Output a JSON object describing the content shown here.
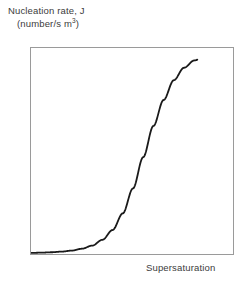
{
  "figure": {
    "background_color": "#ffffff",
    "frame_color": "#9a9a9a",
    "curve_color": "#1a1a1a",
    "text_color": "#3b3b3b"
  },
  "labels": {
    "y_axis_line1": "Nucleation rate, J",
    "y_axis_line2_prefix": "(number/s m",
    "y_axis_line2_exponent": "3",
    "y_axis_line2_suffix": ")",
    "x_axis": "Supersaturation"
  },
  "chart_data": {
    "type": "line",
    "title": "",
    "subtitle": "",
    "xlabel": "Supersaturation",
    "ylabel": "Nucleation rate, J (number/s m3)",
    "xticks": [],
    "yticks": [],
    "xticklabels": [],
    "yticklabels": [],
    "grid": false,
    "legend": false,
    "legend_position": "none",
    "xlim": [
      0,
      1
    ],
    "ylim": [
      0,
      1
    ],
    "annotations": [],
    "series": [
      {
        "name": "Nucleation rate vs supersaturation",
        "shape": "sigmoid",
        "x": [
          0.0,
          0.05,
          0.1,
          0.15,
          0.2,
          0.25,
          0.3,
          0.35,
          0.4,
          0.45,
          0.5,
          0.55,
          0.6,
          0.65,
          0.7,
          0.75,
          0.8,
          0.85,
          0.9,
          0.95,
          1.0
        ],
        "y": [
          0.015,
          0.016,
          0.018,
          0.021,
          0.026,
          0.035,
          0.05,
          0.078,
          0.125,
          0.205,
          0.325,
          0.475,
          0.625,
          0.75,
          0.845,
          0.905,
          0.94,
          0.958,
          0.968,
          0.974,
          0.978
        ]
      }
    ]
  }
}
